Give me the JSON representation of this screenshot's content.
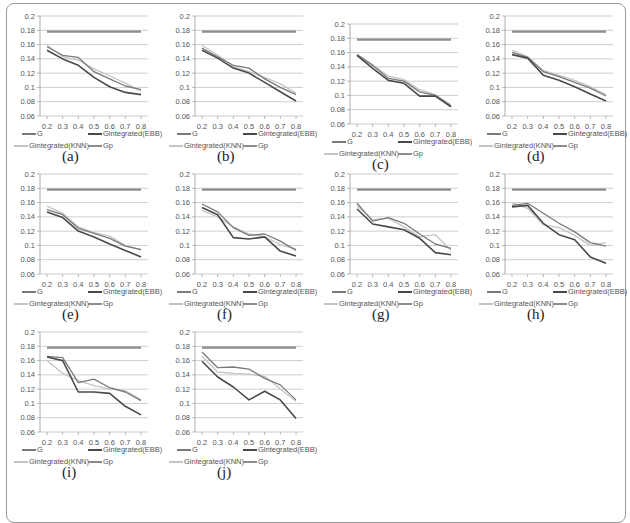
{
  "chart_data": [
    {
      "panel": "(a)",
      "type": "line",
      "x": [
        0.2,
        0.3,
        0.4,
        0.5,
        0.6,
        0.7,
        0.8
      ],
      "ylim": [
        0.06,
        0.2
      ],
      "yticks": [
        "0.2",
        "0.18",
        "0.16",
        "0.14",
        "0.12",
        "0.1",
        "0.08",
        "0.06"
      ],
      "xticks": [
        "0.2",
        "0.3",
        "0.4",
        "0.5",
        "0.6",
        "0.7",
        "0.8"
      ],
      "series": [
        {
          "name": "G",
          "values": [
            0.157,
            0.145,
            0.142,
            0.122,
            0.112,
            0.102,
            0.097
          ]
        },
        {
          "name": "Gintegrated(EBB)",
          "values": [
            0.152,
            0.14,
            0.131,
            0.114,
            0.101,
            0.093,
            0.09
          ]
        },
        {
          "name": "Gintegrated(KNN)",
          "values": [
            0.159,
            0.143,
            0.138,
            0.126,
            0.116,
            0.106,
            0.095
          ]
        },
        {
          "name": "Gp",
          "values": [
            0.178,
            0.178,
            0.178,
            0.178,
            0.178,
            0.178,
            0.178
          ]
        }
      ]
    },
    {
      "panel": "(b)",
      "type": "line",
      "x": [
        0.2,
        0.3,
        0.4,
        0.5,
        0.6,
        0.7,
        0.8
      ],
      "ylim": [
        0.06,
        0.2
      ],
      "yticks": [
        "0.2",
        "0.18",
        "0.16",
        "0.14",
        "0.12",
        "0.1",
        "0.08",
        "0.06"
      ],
      "xticks": [
        "0.2",
        "0.3",
        "0.4",
        "0.5",
        "0.6",
        "0.7",
        "0.8"
      ],
      "series": [
        {
          "name": "G",
          "values": [
            0.155,
            0.143,
            0.131,
            0.127,
            0.112,
            0.1,
            0.09
          ]
        },
        {
          "name": "Gintegrated(EBB)",
          "values": [
            0.152,
            0.141,
            0.127,
            0.12,
            0.107,
            0.094,
            0.081
          ]
        },
        {
          "name": "Gintegrated(KNN)",
          "values": [
            0.159,
            0.145,
            0.129,
            0.122,
            0.114,
            0.105,
            0.092
          ]
        },
        {
          "name": "Gp",
          "values": [
            0.178,
            0.178,
            0.178,
            0.178,
            0.178,
            0.178,
            0.178
          ]
        }
      ]
    },
    {
      "panel": "(c)",
      "type": "line",
      "x": [
        0.2,
        0.3,
        0.4,
        0.5,
        0.6,
        0.7,
        0.8
      ],
      "ylim": [
        0.06,
        0.2
      ],
      "yticks": [
        "0.2",
        "0.18",
        "0.16",
        "0.14",
        "0.12",
        "0.1",
        "0.08",
        "0.06"
      ],
      "xticks": [
        "0.2",
        "0.3",
        "0.4",
        "0.5",
        "0.6",
        "0.7",
        "0.8"
      ],
      "series": [
        {
          "name": "G",
          "values": [
            0.157,
            0.142,
            0.124,
            0.12,
            0.105,
            0.1,
            0.085
          ]
        },
        {
          "name": "Gintegrated(EBB)",
          "values": [
            0.156,
            0.138,
            0.121,
            0.117,
            0.099,
            0.099,
            0.084
          ]
        },
        {
          "name": "Gintegrated(KNN)",
          "values": [
            0.158,
            0.143,
            0.127,
            0.122,
            0.108,
            0.101,
            0.087
          ]
        },
        {
          "name": "Gp",
          "values": [
            0.178,
            0.178,
            0.178,
            0.178,
            0.178,
            0.178,
            0.178
          ]
        }
      ]
    },
    {
      "panel": "(d)",
      "type": "line",
      "x": [
        0.2,
        0.3,
        0.4,
        0.5,
        0.6,
        0.7,
        0.8
      ],
      "ylim": [
        0.06,
        0.2
      ],
      "yticks": [
        "0.2",
        "0.18",
        "0.16",
        "0.14",
        "0.12",
        "0.1",
        "0.08",
        "0.06"
      ],
      "xticks": [
        "0.2",
        "0.3",
        "0.4",
        "0.5",
        "0.6",
        "0.7",
        "0.8"
      ],
      "series": [
        {
          "name": "G",
          "values": [
            0.149,
            0.142,
            0.122,
            0.115,
            0.107,
            0.099,
            0.088
          ]
        },
        {
          "name": "Gintegrated(EBB)",
          "values": [
            0.146,
            0.141,
            0.117,
            0.11,
            0.101,
            0.091,
            0.081
          ]
        },
        {
          "name": "Gintegrated(KNN)",
          "values": [
            0.152,
            0.143,
            0.124,
            0.117,
            0.11,
            0.101,
            0.09
          ]
        },
        {
          "name": "Gp",
          "values": [
            0.178,
            0.178,
            0.178,
            0.178,
            0.178,
            0.178,
            0.178
          ]
        }
      ]
    },
    {
      "panel": "(e)",
      "type": "line",
      "x": [
        0.2,
        0.3,
        0.4,
        0.5,
        0.6,
        0.7,
        0.8
      ],
      "ylim": [
        0.06,
        0.2
      ],
      "yticks": [
        "0.2",
        "0.18",
        "0.16",
        "0.14",
        "0.12",
        "0.1",
        "0.08",
        "0.06"
      ],
      "xticks": [
        "0.2",
        "0.3",
        "0.4",
        "0.5",
        "0.6",
        "0.7",
        "0.8"
      ],
      "series": [
        {
          "name": "G",
          "values": [
            0.15,
            0.143,
            0.124,
            0.117,
            0.11,
            0.099,
            0.094
          ]
        },
        {
          "name": "Gintegrated(EBB)",
          "values": [
            0.147,
            0.139,
            0.12,
            0.112,
            0.102,
            0.093,
            0.084
          ]
        },
        {
          "name": "Gintegrated(KNN)",
          "values": [
            0.155,
            0.145,
            0.126,
            0.118,
            0.113,
            0.1,
            0.094
          ]
        },
        {
          "name": "Gp",
          "values": [
            0.178,
            0.178,
            0.178,
            0.178,
            0.178,
            0.178,
            0.178
          ]
        }
      ]
    },
    {
      "panel": "(f)",
      "type": "line",
      "x": [
        0.2,
        0.3,
        0.4,
        0.5,
        0.6,
        0.7,
        0.8
      ],
      "ylim": [
        0.06,
        0.2
      ],
      "yticks": [
        "0.2",
        "0.18",
        "0.16",
        "0.14",
        "0.12",
        "0.1",
        "0.08",
        "0.06"
      ],
      "xticks": [
        "0.2",
        "0.3",
        "0.4",
        "0.5",
        "0.6",
        "0.7",
        "0.8"
      ],
      "series": [
        {
          "name": "G",
          "values": [
            0.158,
            0.147,
            0.125,
            0.114,
            0.116,
            0.106,
            0.093
          ]
        },
        {
          "name": "Gintegrated(EBB)",
          "values": [
            0.153,
            0.143,
            0.111,
            0.109,
            0.112,
            0.092,
            0.085
          ]
        },
        {
          "name": "Gintegrated(KNN)",
          "values": [
            0.149,
            0.14,
            0.126,
            0.116,
            0.112,
            0.101,
            0.095
          ]
        },
        {
          "name": "Gp",
          "values": [
            0.178,
            0.178,
            0.178,
            0.178,
            0.178,
            0.178,
            0.178
          ]
        }
      ]
    },
    {
      "panel": "(g)",
      "type": "line",
      "x": [
        0.2,
        0.3,
        0.4,
        0.5,
        0.6,
        0.7,
        0.8
      ],
      "ylim": [
        0.06,
        0.2
      ],
      "yticks": [
        "0.2",
        "0.18",
        "0.16",
        "0.14",
        "0.12",
        "0.1",
        "0.08",
        "0.06"
      ],
      "xticks": [
        "0.2",
        "0.3",
        "0.4",
        "0.5",
        "0.6",
        "0.7",
        "0.8"
      ],
      "series": [
        {
          "name": "G",
          "values": [
            0.159,
            0.134,
            0.139,
            0.131,
            0.116,
            0.102,
            0.096
          ]
        },
        {
          "name": "Gintegrated(EBB)",
          "values": [
            0.151,
            0.13,
            0.126,
            0.122,
            0.11,
            0.09,
            0.087
          ]
        },
        {
          "name": "Gintegrated(KNN)",
          "values": [
            0.155,
            0.136,
            0.138,
            0.126,
            0.112,
            0.115,
            0.093
          ]
        },
        {
          "name": "Gp",
          "values": [
            0.178,
            0.178,
            0.178,
            0.178,
            0.178,
            0.178,
            0.178
          ]
        }
      ]
    },
    {
      "panel": "(h)",
      "type": "line",
      "x": [
        0.2,
        0.3,
        0.4,
        0.5,
        0.6,
        0.7,
        0.8
      ],
      "ylim": [
        0.06,
        0.2
      ],
      "yticks": [
        "0.2",
        "0.18",
        "0.16",
        "0.14",
        "0.12",
        "0.1",
        "0.08",
        "0.06"
      ],
      "xticks": [
        "0.2",
        "0.3",
        "0.4",
        "0.5",
        "0.6",
        "0.7",
        "0.8"
      ],
      "series": [
        {
          "name": "G",
          "values": [
            0.156,
            0.159,
            0.145,
            0.131,
            0.119,
            0.104,
            0.099
          ]
        },
        {
          "name": "Gintegrated(EBB)",
          "values": [
            0.154,
            0.156,
            0.131,
            0.115,
            0.108,
            0.084,
            0.075
          ]
        },
        {
          "name": "Gintegrated(KNN)",
          "values": [
            0.16,
            0.152,
            0.129,
            0.125,
            0.114,
            0.1,
            0.104
          ]
        },
        {
          "name": "Gp",
          "values": [
            0.178,
            0.178,
            0.178,
            0.178,
            0.178,
            0.178,
            0.178
          ]
        }
      ]
    },
    {
      "panel": "(i)",
      "type": "line",
      "x": [
        0.2,
        0.3,
        0.4,
        0.5,
        0.6,
        0.7,
        0.8
      ],
      "ylim": [
        0.06,
        0.2
      ],
      "yticks": [
        "0.2",
        "0.18",
        "0.16",
        "0.14",
        "0.12",
        "0.1",
        "0.08",
        "0.06"
      ],
      "xticks": [
        "0.2",
        "0.3",
        "0.4",
        "0.5",
        "0.6",
        "0.7",
        "0.8"
      ],
      "series": [
        {
          "name": "G",
          "values": [
            0.166,
            0.164,
            0.129,
            0.134,
            0.122,
            0.116,
            0.104
          ]
        },
        {
          "name": "Gintegrated(EBB)",
          "values": [
            0.165,
            0.16,
            0.116,
            0.116,
            0.114,
            0.096,
            0.084
          ]
        },
        {
          "name": "Gintegrated(KNN)",
          "values": [
            0.16,
            0.142,
            0.132,
            0.125,
            0.12,
            0.118,
            0.105
          ]
        },
        {
          "name": "Gp",
          "values": [
            0.178,
            0.178,
            0.178,
            0.178,
            0.178,
            0.178,
            0.178
          ]
        }
      ]
    },
    {
      "panel": "(j)",
      "type": "line",
      "x": [
        0.2,
        0.3,
        0.4,
        0.5,
        0.6,
        0.7,
        0.8
      ],
      "ylim": [
        0.06,
        0.2
      ],
      "yticks": [
        "0.2",
        "0.18",
        "0.16",
        "0.14",
        "0.12",
        "0.1",
        "0.08",
        "0.06"
      ],
      "xticks": [
        "0.2",
        "0.3",
        "0.4",
        "0.5",
        "0.6",
        "0.7",
        "0.8"
      ],
      "series": [
        {
          "name": "G",
          "values": [
            0.172,
            0.15,
            0.151,
            0.148,
            0.135,
            0.126,
            0.105
          ]
        },
        {
          "name": "Gintegrated(EBB)",
          "values": [
            0.159,
            0.137,
            0.123,
            0.105,
            0.117,
            0.105,
            0.079
          ]
        },
        {
          "name": "Gintegrated(KNN)",
          "values": [
            0.166,
            0.144,
            0.142,
            0.141,
            0.138,
            0.12,
            0.103
          ]
        },
        {
          "name": "Gp",
          "values": [
            0.178,
            0.178,
            0.178,
            0.178,
            0.178,
            0.178,
            0.178
          ]
        }
      ]
    }
  ],
  "legend": {
    "entries": [
      "G",
      "Gintegrated(EBB)",
      "Gintegrated(KNN)",
      "Gp"
    ],
    "colors": {
      "G": "#7a7a7a",
      "Gintegrated(EBB)": "#4a4a4a",
      "Gintegrated(KNN)": "#c4c4c4",
      "Gp": "#8c8c8c"
    }
  },
  "panel_labels": [
    "(a)",
    "(b)",
    "(c)",
    "(d)",
    "(e)",
    "(f)",
    "(g)",
    "(h)",
    "(i)",
    "(j)"
  ],
  "caption": "Sample weight estimate (...)"
}
